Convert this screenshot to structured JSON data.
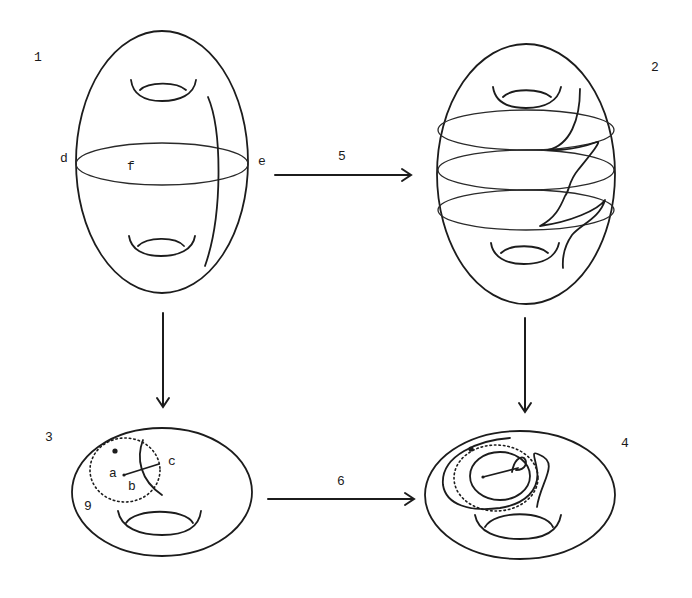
{
  "figure": {
    "panels": [
      {
        "id": "1",
        "label": "1",
        "shape": "genus-2 surface (vertical ellipse) with meridian circle and curve",
        "point_labels": {
          "d": "d",
          "e": "e",
          "f": "f"
        }
      },
      {
        "id": "2",
        "label": "2",
        "shape": "genus-2 surface with three circles and twisted curve"
      },
      {
        "id": "3",
        "label": "3",
        "shape": "torus with dotted disk and arc",
        "point_labels": {
          "a": "a",
          "b": "b",
          "c": "c",
          "g": "9"
        }
      },
      {
        "id": "4",
        "label": "4",
        "shape": "torus with spiraling curve around dotted disk"
      }
    ],
    "arrows": [
      {
        "id": "5",
        "label": "5",
        "from": "1",
        "to": "2",
        "direction": "right"
      },
      {
        "id": "6",
        "label": "6",
        "from": "3",
        "to": "4",
        "direction": "right"
      },
      {
        "id": "down-left",
        "label": "",
        "from": "1",
        "to": "3",
        "direction": "down"
      },
      {
        "id": "down-right",
        "label": "",
        "from": "2",
        "to": "4",
        "direction": "down"
      }
    ],
    "colors": {
      "ink": "#1c1c1c",
      "background": "#ffffff"
    }
  }
}
